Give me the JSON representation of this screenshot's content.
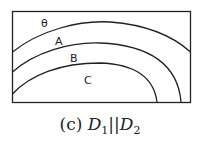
{
  "figure": {
    "regions": [
      {
        "label": "θ"
      },
      {
        "label": "A"
      },
      {
        "label": "B"
      },
      {
        "label": "C"
      }
    ],
    "caption": {
      "prefix": "(c)",
      "d1": "D",
      "d1_sub": "1",
      "sep": "||",
      "d2": "D",
      "d2_sub": "2"
    },
    "colors": {
      "stroke": "#222222",
      "background": "#ffffff"
    }
  }
}
